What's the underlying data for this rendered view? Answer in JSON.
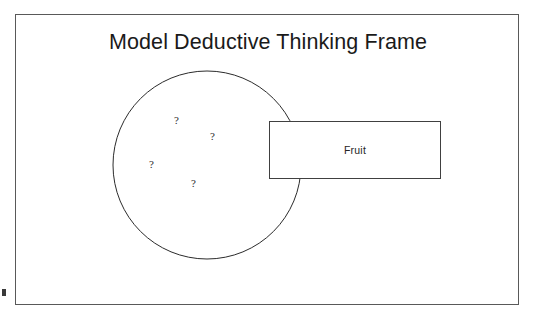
{
  "slide": {
    "title": "Model Deductive Thinking Frame",
    "background_color": "#ffffff",
    "frame_border_color": "#595959"
  },
  "diagram": {
    "type": "deductive-thinking-frame",
    "circle": {
      "name": "unknown-set-circle",
      "stroke_color": "#2b2b2b",
      "fill_color": "#ffffff",
      "center_x": 206,
      "center_y": 164,
      "radius": 94
    },
    "question_marks": [
      {
        "label": "?",
        "x": 173,
        "y": 115
      },
      {
        "label": "?",
        "x": 209,
        "y": 131
      },
      {
        "label": "?",
        "x": 148,
        "y": 159
      },
      {
        "label": "?",
        "x": 190,
        "y": 178
      }
    ],
    "category_box": {
      "name": "fruit-category-box",
      "label": "Fruit",
      "stroke_color": "#404040",
      "fill_color": "#ffffff",
      "x": 268,
      "y": 120,
      "width": 172,
      "height": 58
    }
  }
}
